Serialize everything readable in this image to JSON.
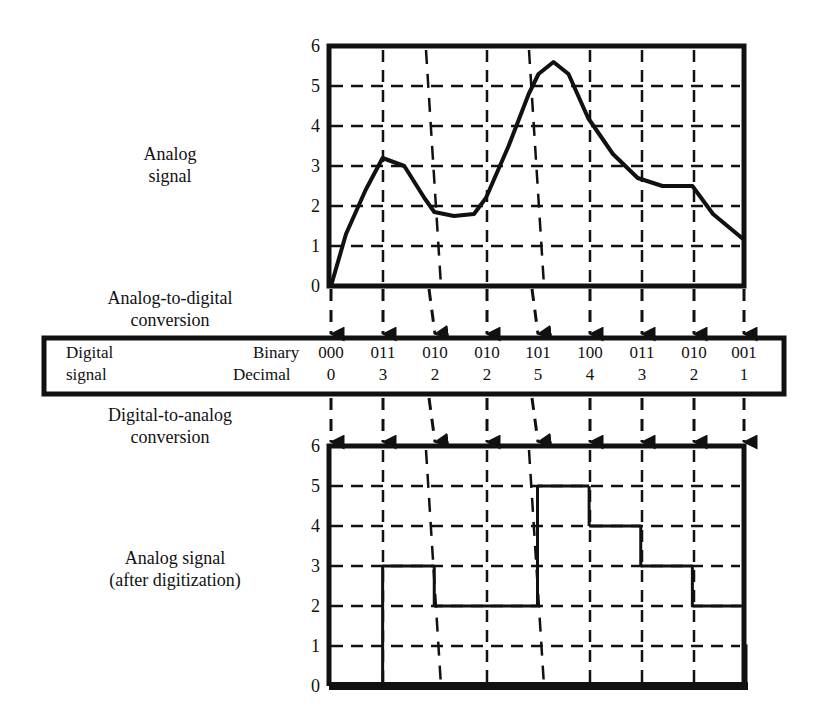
{
  "labels": {
    "analog_signal": [
      "Analog",
      "signal"
    ],
    "adc": [
      "Analog-to-digital",
      "conversion"
    ],
    "digital_signal": [
      "Digital",
      "signal"
    ],
    "binary_row": "Binary",
    "decimal_row": "Decimal",
    "dac": [
      "Digital-to-analog",
      "conversion"
    ],
    "after": [
      "Analog signal",
      "(after digitization)"
    ]
  },
  "samples": {
    "binary": [
      "000",
      "011",
      "010",
      "010",
      "101",
      "100",
      "011",
      "010",
      "001"
    ],
    "decimal": [
      "0",
      "3",
      "2",
      "2",
      "5",
      "4",
      "3",
      "2",
      "1"
    ]
  },
  "axis": {
    "ticks": [
      "0",
      "1",
      "2",
      "3",
      "4",
      "5",
      "6"
    ]
  },
  "chart_data": [
    {
      "type": "line",
      "title": "Analog signal",
      "xlabel": "",
      "ylabel": "",
      "ylim": [
        0,
        6
      ],
      "yticks": [
        0,
        1,
        2,
        3,
        4,
        5,
        6
      ],
      "grid": true,
      "sample_points": [
        0,
        1,
        2,
        3,
        4,
        5,
        6,
        7,
        8
      ],
      "x": [
        0,
        0.29,
        0.67,
        1.0,
        1.42,
        1.81,
        2.0,
        2.38,
        2.77,
        3.0,
        3.44,
        3.83,
        4.02,
        4.31,
        4.6,
        4.98,
        5.46,
        5.94,
        6.42,
        7.0,
        7.4,
        7.96
      ],
      "values": [
        0,
        1.3,
        2.4,
        3.2,
        3.0,
        2.2,
        1.85,
        1.75,
        1.8,
        2.2,
        3.5,
        4.8,
        5.3,
        5.6,
        5.3,
        4.2,
        3.3,
        2.7,
        2.5,
        2.5,
        1.8,
        1.2
      ]
    },
    {
      "type": "line",
      "title": "Analog signal (after digitization)",
      "xlabel": "",
      "ylabel": "",
      "ylim": [
        0,
        6
      ],
      "yticks": [
        0,
        1,
        2,
        3,
        4,
        5,
        6
      ],
      "grid": true,
      "step": true,
      "x": [
        0,
        1,
        2,
        3,
        4,
        5,
        6,
        7,
        8
      ],
      "values": [
        0,
        3,
        2,
        2,
        5,
        4,
        3,
        2,
        1
      ]
    }
  ]
}
